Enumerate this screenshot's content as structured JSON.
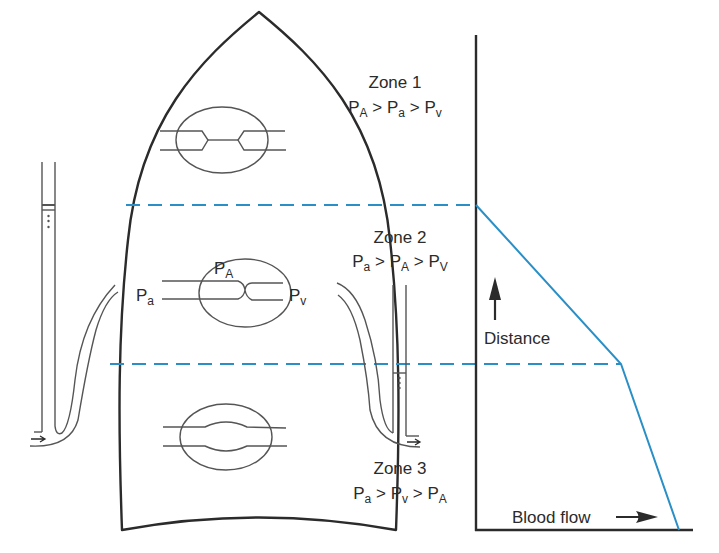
{
  "colors": {
    "ink": "#2b2b2b",
    "capillary": "#555555",
    "accent_blue": "#2a8fc7",
    "background": "#ffffff"
  },
  "zones": [
    {
      "title": "Zone 1",
      "relation": [
        {
          "base": "P",
          "sub": "A"
        },
        {
          "op": ">"
        },
        {
          "base": "P",
          "sub": "a"
        },
        {
          "op": ">"
        },
        {
          "base": "P",
          "sub": "v"
        }
      ]
    },
    {
      "title": "Zone 2",
      "relation": [
        {
          "base": "P",
          "sub": "a"
        },
        {
          "op": ">"
        },
        {
          "base": "P",
          "sub": "A"
        },
        {
          "op": ">"
        },
        {
          "base": "P",
          "sub": "V"
        }
      ]
    },
    {
      "title": "Zone 3",
      "relation": [
        {
          "base": "P",
          "sub": "a"
        },
        {
          "op": ">"
        },
        {
          "base": "P",
          "sub": "v"
        },
        {
          "op": ">"
        },
        {
          "base": "P",
          "sub": "A"
        }
      ]
    }
  ],
  "capillary_labels": {
    "arterial": {
      "base": "P",
      "sub": "a"
    },
    "alveolar": {
      "base": "P",
      "sub": "A"
    },
    "venous": {
      "base": "P",
      "sub": "v"
    }
  },
  "chart": {
    "y_axis_label": "Distance",
    "x_axis_label": "Blood flow",
    "profile_points": [
      [
        476,
        205
      ],
      [
        621,
        364
      ],
      [
        679,
        530
      ]
    ],
    "zone_boundaries_y": [
      205,
      364
    ]
  }
}
